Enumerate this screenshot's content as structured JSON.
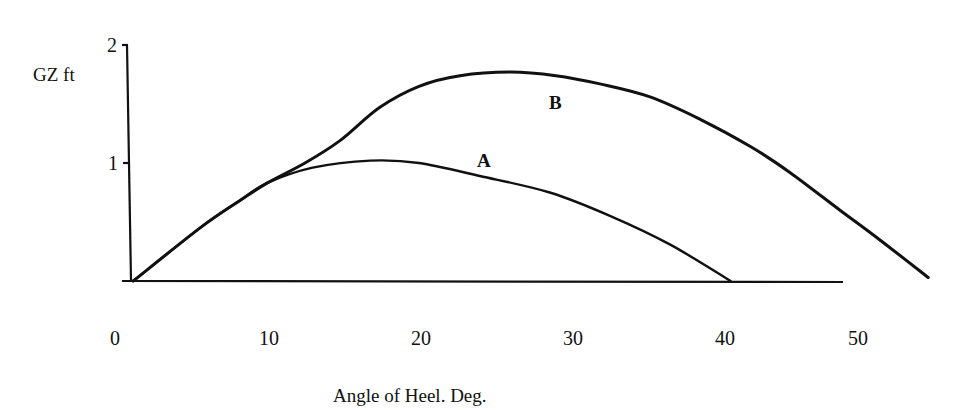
{
  "chart_data": {
    "type": "line",
    "title": "",
    "xlabel": "Angle of Heel. Deg.",
    "ylabel": "GZ ft",
    "xlim": [
      0,
      55
    ],
    "ylim": [
      0,
      2
    ],
    "x_ticks": [
      "0",
      "10",
      "20",
      "30",
      "40",
      "50"
    ],
    "y_ticks": [
      "1",
      "2"
    ],
    "grid": false,
    "legend": "inline labels on curves",
    "series": [
      {
        "name": "A",
        "x": [
          1.2,
          5.6,
          8.2,
          10.0,
          13.0,
          16.8,
          20.0,
          24.0,
          28.6,
          32.6,
          36.5,
          40.5
        ],
        "values": [
          0.0,
          0.45,
          0.68,
          0.83,
          0.96,
          1.02,
          1.0,
          0.89,
          0.75,
          0.55,
          0.31,
          0.0
        ]
      },
      {
        "name": "B",
        "x": [
          1.2,
          5.6,
          8.2,
          10.0,
          12.5,
          14.8,
          17.4,
          20.0,
          22.7,
          26.0,
          29.0,
          31.9,
          35.2,
          38.5,
          41.8,
          44.4,
          47.7,
          50.3,
          53.5
        ],
        "values": [
          0.0,
          0.45,
          0.68,
          0.83,
          1.0,
          1.19,
          1.47,
          1.65,
          1.74,
          1.77,
          1.74,
          1.67,
          1.56,
          1.37,
          1.14,
          0.92,
          0.6,
          0.35,
          0.03
        ]
      }
    ],
    "annotations": [
      {
        "text": "A",
        "x": 24.3,
        "y": 1.03
      },
      {
        "text": "B",
        "x": 29.2,
        "y": 1.53
      }
    ]
  },
  "labels": {
    "ylabel": "GZ ft",
    "xlabel": "Angle of Heel. Deg.",
    "x_ticks": [
      "0",
      "10",
      "20",
      "30",
      "40",
      "50"
    ],
    "y_tick_1": "1",
    "y_tick_2": "2",
    "series_a": "A",
    "series_b": "B"
  }
}
